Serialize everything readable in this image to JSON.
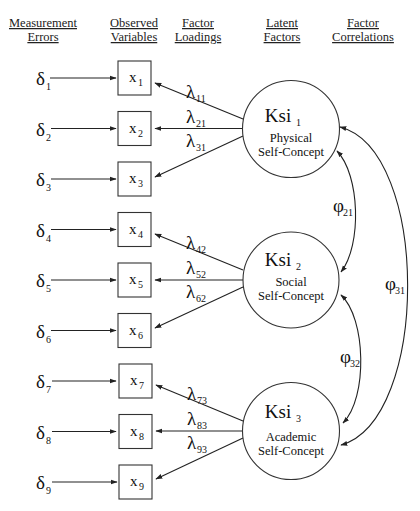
{
  "headers": [
    {
      "line1": "Measurement",
      "line2": "Errors",
      "x": 43
    },
    {
      "line1": "Observed",
      "line2": "Variables",
      "x": 134
    },
    {
      "line1": "Factor",
      "line2": "Loadings",
      "x": 198
    },
    {
      "line1": "Latent",
      "line2": "Factors",
      "x": 282
    },
    {
      "line1": "Factor",
      "line2": "Correlations",
      "x": 363
    }
  ],
  "errors": [
    {
      "symbol": "δ",
      "sub": "1"
    },
    {
      "symbol": "δ",
      "sub": "2"
    },
    {
      "symbol": "δ",
      "sub": "3"
    },
    {
      "symbol": "δ",
      "sub": "4"
    },
    {
      "symbol": "δ",
      "sub": "5"
    },
    {
      "symbol": "δ",
      "sub": "6"
    },
    {
      "symbol": "δ",
      "sub": "7"
    },
    {
      "symbol": "δ",
      "sub": "8"
    },
    {
      "symbol": "δ",
      "sub": "9"
    }
  ],
  "observed": [
    {
      "symbol": "x",
      "sub": "1"
    },
    {
      "symbol": "x",
      "sub": "2"
    },
    {
      "symbol": "x",
      "sub": "3"
    },
    {
      "symbol": "x",
      "sub": "4"
    },
    {
      "symbol": "x",
      "sub": "5"
    },
    {
      "symbol": "x",
      "sub": "6"
    },
    {
      "symbol": "x",
      "sub": "7"
    },
    {
      "symbol": "x",
      "sub": "8"
    },
    {
      "symbol": "x",
      "sub": "9"
    }
  ],
  "loadings": [
    {
      "symbol": "λ",
      "sub": "11"
    },
    {
      "symbol": "λ",
      "sub": "21"
    },
    {
      "symbol": "λ",
      "sub": "31"
    },
    {
      "symbol": "λ",
      "sub": "42"
    },
    {
      "symbol": "λ",
      "sub": "52"
    },
    {
      "symbol": "λ",
      "sub": "62"
    },
    {
      "symbol": "λ",
      "sub": "73"
    },
    {
      "symbol": "λ",
      "sub": "83"
    },
    {
      "symbol": "λ",
      "sub": "93"
    }
  ],
  "factors": [
    {
      "name": "Ksi",
      "sub": "1",
      "line1": "Physical",
      "line2": "Self-Concept"
    },
    {
      "name": "Ksi",
      "sub": "2",
      "line1": "Social",
      "line2": "Self-Concept"
    },
    {
      "name": "Ksi",
      "sub": "3",
      "line1": "Academic",
      "line2": "Self-Concept"
    }
  ],
  "correlations": [
    {
      "symbol": "φ",
      "sub": "21"
    },
    {
      "symbol": "φ",
      "sub": "32"
    },
    {
      "symbol": "φ",
      "sub": "31"
    }
  ]
}
